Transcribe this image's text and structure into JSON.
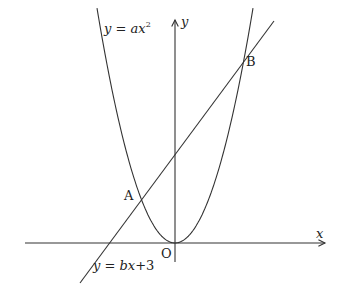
{
  "diagram": {
    "axes": {
      "x_label": "x",
      "y_label": "y",
      "origin_label": "O"
    },
    "curves": [
      {
        "id": "parabola",
        "equation": "y = ax²",
        "label": "y = ax",
        "superscript": "2"
      },
      {
        "id": "line",
        "equation": "y = bx+3",
        "label": "y = bx+3"
      }
    ],
    "points": [
      {
        "id": "A",
        "label": "A"
      },
      {
        "id": "B",
        "label": "B"
      }
    ],
    "colors": {
      "stroke": "#333333",
      "text": "#222222",
      "background": "#ffffff"
    }
  }
}
